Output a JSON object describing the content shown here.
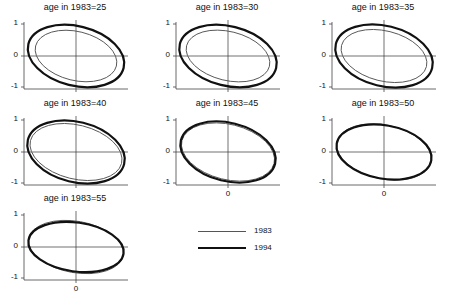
{
  "chart_data": {
    "type": "line",
    "xlabel": "",
    "ylabel": "",
    "ylim": [
      -1,
      1
    ],
    "yticks": [
      "1",
      "0",
      "-1"
    ],
    "xticks": [
      "0"
    ],
    "grid": false,
    "legend": {
      "position": "bottom-center",
      "entries": [
        {
          "label": "1983",
          "style": "thin",
          "color": "#555555"
        },
        {
          "label": "1994",
          "style": "thick",
          "color": "#111111"
        }
      ]
    },
    "panels": [
      {
        "title": "age in 1983=25",
        "show_x_tick": false,
        "series": [
          {
            "name": "1983",
            "rx": 0.78,
            "ry": 0.78,
            "tilt": -14,
            "cx": 0.0,
            "cy": 0.0
          },
          {
            "name": "1994",
            "rx": 0.92,
            "ry": 0.95,
            "tilt": -14,
            "cx": 0.0,
            "cy": 0.0
          }
        ]
      },
      {
        "title": "age in 1983=30",
        "show_x_tick": false,
        "series": [
          {
            "name": "1983",
            "rx": 0.8,
            "ry": 0.78,
            "tilt": -14,
            "cx": 0.0,
            "cy": 0.0
          },
          {
            "name": "1994",
            "rx": 0.93,
            "ry": 0.95,
            "tilt": -14,
            "cx": 0.0,
            "cy": 0.0
          }
        ]
      },
      {
        "title": "age in 1983=35",
        "show_x_tick": false,
        "series": [
          {
            "name": "1983",
            "rx": 0.82,
            "ry": 0.8,
            "tilt": -14,
            "cx": 0.0,
            "cy": 0.0
          },
          {
            "name": "1994",
            "rx": 0.93,
            "ry": 0.96,
            "tilt": -14,
            "cx": 0.0,
            "cy": 0.0
          }
        ]
      },
      {
        "title": "age in 1983=40",
        "show_x_tick": false,
        "series": [
          {
            "name": "1983",
            "rx": 0.88,
            "ry": 0.86,
            "tilt": -14,
            "cx": 0.0,
            "cy": 0.0
          },
          {
            "name": "1994",
            "rx": 0.93,
            "ry": 0.96,
            "tilt": -14,
            "cx": 0.0,
            "cy": 0.0
          }
        ]
      },
      {
        "title": "age in 1983=45",
        "show_x_tick": true,
        "series": [
          {
            "name": "1983",
            "rx": 0.89,
            "ry": 0.88,
            "tilt": -14,
            "cx": 0.0,
            "cy": 0.0
          },
          {
            "name": "1994",
            "rx": 0.91,
            "ry": 0.93,
            "tilt": -14,
            "cx": 0.0,
            "cy": 0.0
          }
        ]
      },
      {
        "title": "age in 1983=50",
        "show_x_tick": true,
        "series": [
          {
            "name": "1983",
            "rx": 0.9,
            "ry": 0.86,
            "tilt": -12,
            "cx": 0.0,
            "cy": 0.0
          },
          {
            "name": "1994",
            "rx": 0.9,
            "ry": 0.85,
            "tilt": -10,
            "cx": 0.0,
            "cy": 0.0
          }
        ]
      },
      {
        "title": "age in 1983=55",
        "show_x_tick": true,
        "series": [
          {
            "name": "1983",
            "rx": 0.9,
            "ry": 0.82,
            "tilt": -10,
            "cx": 0.0,
            "cy": 0.0
          },
          {
            "name": "1994",
            "rx": 0.9,
            "ry": 0.78,
            "tilt": -8,
            "cx": 0.0,
            "cy": 0.0
          }
        ]
      }
    ]
  },
  "panels": [
    {
      "title": "age in 1983=25"
    },
    {
      "title": "age in 1983=30"
    },
    {
      "title": "age in 1983=35"
    },
    {
      "title": "age in 1983=40"
    },
    {
      "title": "age in 1983=45"
    },
    {
      "title": "age in 1983=50"
    },
    {
      "title": "age in 1983=55"
    }
  ],
  "axis": {
    "y_top": "1",
    "y_mid": "0",
    "y_bot": "-1",
    "x_zero": "0"
  },
  "legend": {
    "label_1983": "1983",
    "label_1994": "1994"
  }
}
